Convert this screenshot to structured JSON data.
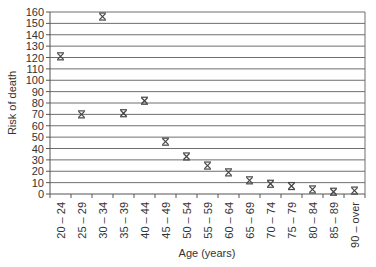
{
  "chart_data": {
    "type": "scatter",
    "title": "",
    "xlabel": "Age (years)",
    "ylabel": "Risk of death",
    "categories": [
      "20 – 24",
      "25 – 29",
      "30 – 34",
      "35 – 39",
      "40 – 44",
      "45 – 49",
      "50 – 54",
      "55 – 59",
      "60 – 64",
      "65 – 69",
      "70 – 74",
      "75 – 79",
      "80 – 84",
      "85 – 89",
      "90 – over"
    ],
    "series": [
      {
        "name": "Risk of death",
        "values": [
          121,
          70,
          156,
          71,
          82,
          46,
          33,
          25,
          19,
          12,
          9,
          7,
          4,
          2,
          3
        ]
      }
    ],
    "ylim": [
      0,
      160
    ],
    "yticks": [
      0,
      10,
      20,
      30,
      40,
      50,
      60,
      70,
      80,
      90,
      100,
      110,
      120,
      130,
      140,
      150,
      160
    ],
    "grid": true,
    "legend": "none",
    "marker": "asterisk-x"
  },
  "colors": {
    "grid": "#6e6e6e",
    "axis": "#555555",
    "marker": "#444444",
    "text": "#333333"
  }
}
